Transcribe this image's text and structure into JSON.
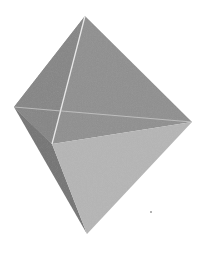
{
  "image": {
    "subject": "gray octahedron (bipyramid) rendering",
    "background": "#ffffff",
    "colors": {
      "upper_front_face": "#8c8c8c",
      "upper_left_face": "#7e7e7e",
      "lower_left_face": "#6e6e6e",
      "lower_front_face": "#b4b4b4",
      "edge_highlight": "#e6e6e6"
    },
    "vertices": {
      "top": [
        85,
        16
      ],
      "left": [
        14,
        107
      ],
      "right": [
        192,
        122
      ],
      "bottom": [
        87,
        234
      ],
      "front": [
        52,
        144
      ]
    }
  }
}
